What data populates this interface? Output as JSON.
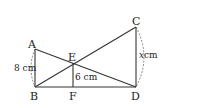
{
  "diagram": {
    "type": "geometry",
    "points": {
      "A": {
        "label": "A",
        "x": 35,
        "y": 49
      },
      "B": {
        "label": "B",
        "x": 35,
        "y": 87
      },
      "C": {
        "label": "C",
        "x": 136,
        "y": 27
      },
      "D": {
        "label": "D",
        "x": 136,
        "y": 87
      },
      "E": {
        "label": "E",
        "x": 73,
        "y": 63
      },
      "F": {
        "label": "F",
        "x": 73,
        "y": 87
      }
    },
    "segments": [
      "AB",
      "AD",
      "BC",
      "CD",
      "EF",
      "BD"
    ],
    "measurements": {
      "AB": "8 cm",
      "EF": "6 cm",
      "CD": "x cm"
    },
    "labels": {
      "A": "A",
      "B": "B",
      "C": "C",
      "D": "D",
      "E": "E",
      "F": "F",
      "ab_len": "8 cm",
      "ef_len": "6 cm",
      "cd_len_var": "x",
      "cd_len_unit": "cm"
    }
  }
}
